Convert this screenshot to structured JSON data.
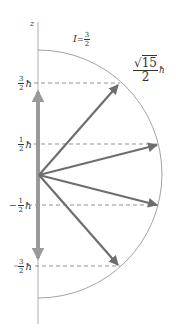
{
  "diagram": {
    "axis_label": "z",
    "spin_label": {
      "symbol": "I",
      "equals": "=",
      "num": "3",
      "den": "2"
    },
    "magnitude_label": {
      "sqrt": "√",
      "radicand": "15",
      "den": "2",
      "unit": "ħ"
    },
    "levels": [
      {
        "sign": "",
        "num": "3",
        "den": "2",
        "unit": "ħ",
        "m": 1.5
      },
      {
        "sign": "",
        "num": "1",
        "den": "2",
        "unit": "ħ",
        "m": 0.5
      },
      {
        "sign": "−",
        "num": "1",
        "den": "2",
        "unit": "ħ",
        "m": -0.5
      },
      {
        "sign": "",
        "num": "3",
        "den": "2",
        "unit": "ħ",
        "m": -1.5
      }
    ],
    "colors": {
      "arrow": "#777777",
      "axis_arrow": "#9a9a9a",
      "arc": "#888888",
      "dashed": "#777777",
      "text": "#333333"
    }
  }
}
